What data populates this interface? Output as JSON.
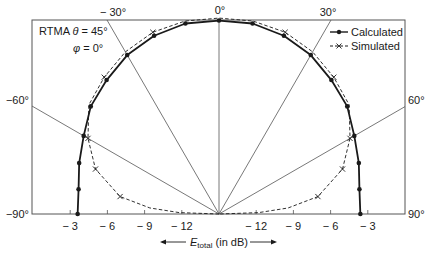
{
  "chart_data": {
    "type": "polar-line",
    "title_lines": [
      "RTMA θ = 45°",
      "φ = 0°"
    ],
    "annotation": {
      "line1_prefix": "RTMA ",
      "line1_sym": "θ",
      "line1_suffix": " = 45°",
      "line2_sym": "φ",
      "line2_suffix": " = 0°"
    },
    "angle_unit": "degrees",
    "angle_range": [
      -90,
      90
    ],
    "angle_labels": {
      "top": [
        {
          "angle": -30,
          "text": "− 30°"
        },
        {
          "angle": 0,
          "text": "0°"
        },
        {
          "angle": 30,
          "text": "30°"
        }
      ],
      "left": [
        {
          "angle": -60,
          "text": "−60°"
        },
        {
          "angle": -90,
          "text": "−90°"
        }
      ],
      "right": [
        {
          "angle": 60,
          "text": "60°"
        },
        {
          "angle": 90,
          "text": "90°"
        }
      ]
    },
    "radial_lines": [
      -60,
      -30,
      0,
      30,
      60
    ],
    "radial_axis": {
      "label_main": "E",
      "label_sub": "total",
      "label_suffix": " (in dB)",
      "ticks": [
        -3,
        -6,
        -9,
        -12
      ],
      "tick_labels": [
        "− 3",
        "− 6",
        "− 9",
        "− 12"
      ],
      "min_db": -15
    },
    "legend": {
      "position": "upper right",
      "entries": [
        "Calculated",
        "Simulated"
      ]
    },
    "series": [
      {
        "name": "Calculated",
        "style": "solid-dot",
        "angles": [
          -90,
          -80,
          -70,
          -60,
          -50,
          -40,
          -30,
          -20,
          -10,
          0,
          10,
          20,
          30,
          40,
          50,
          60,
          70,
          80,
          90
        ],
        "values_db": [
          -3.6,
          -3.5,
          -3.0,
          -2.4,
          -1.5,
          -0.9,
          -0.2,
          0.3,
          0.6,
          0.6,
          0.6,
          0.3,
          -0.2,
          -0.9,
          -1.5,
          -2.4,
          -3.0,
          -3.5,
          -3.6
        ],
        "marker_angles": [
          -90,
          -80,
          -70,
          -60,
          -50,
          -40,
          -30,
          -20,
          -10,
          0,
          10,
          20,
          30,
          40,
          50,
          60,
          70,
          80,
          90
        ]
      },
      {
        "name": "Simulated",
        "style": "dashed-x",
        "angles": [
          -90,
          -88,
          -85,
          -80,
          -70,
          -60,
          -50,
          -40,
          -30,
          -20,
          -10,
          0,
          10,
          20,
          30,
          40,
          50,
          60,
          70,
          80,
          85,
          88,
          90
        ],
        "values_db": [
          -15,
          -11.8,
          -9.4,
          -6.9,
          -4.4,
          -2.8,
          -1.3,
          -0.6,
          0.1,
          0.6,
          0.8,
          0.8,
          0.8,
          0.6,
          0.1,
          -0.6,
          -1.3,
          -2.8,
          -4.4,
          -6.9,
          -9.4,
          -11.8,
          -15
        ],
        "marker_angles": [
          -80,
          -70,
          -60,
          -40,
          -20,
          20,
          40,
          60,
          70,
          80
        ]
      }
    ]
  },
  "colors": {
    "line": "#1a1a1a",
    "grid": "#555555",
    "box": "#555555",
    "background": "#ffffff"
  }
}
